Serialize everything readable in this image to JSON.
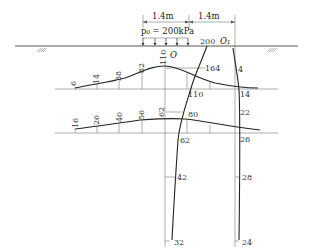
{
  "figure": {
    "dimension_left": "1.4m",
    "dimension_right": "1.4m",
    "load_label": "p₀ = 200kPa",
    "origin_label": "O",
    "origin1_label": "O₁",
    "surface_value": "200"
  },
  "stress_profiles": {
    "horizontal_depth1": {
      "values": [
        "6",
        "14",
        "38",
        "82",
        "110",
        "164",
        "4"
      ],
      "centerline_value": "110",
      "right_value": "14"
    },
    "horizontal_depth2": {
      "values": [
        "16",
        "26",
        "40",
        "56",
        "62",
        "80"
      ],
      "right_value": "26"
    },
    "vertical_center": {
      "values": [
        "200",
        "164",
        "110",
        "80",
        "62",
        "42",
        "32"
      ]
    },
    "vertical_edge": {
      "values": [
        "4",
        "14",
        "22",
        "26",
        "28",
        "24"
      ]
    }
  },
  "colors": {
    "curve": "#222222",
    "grid": "#8a8a8a",
    "text": "#333333"
  }
}
